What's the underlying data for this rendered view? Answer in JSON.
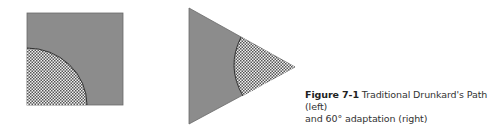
{
  "figure": {
    "label": "Figure 7-1",
    "caption_line1": " Traditional Drunkard's Path (left)",
    "caption_line2": "and 60° adaptation (right)"
  },
  "colors": {
    "fill_gray": "#8c8c8c",
    "hatch_light": "#f2f2f2",
    "hatch_dark": "#555555",
    "outline": "#3a3a3a"
  },
  "shapes": {
    "left": "square-block-quarter-circle",
    "right": "triangle-60-degree-arc"
  }
}
